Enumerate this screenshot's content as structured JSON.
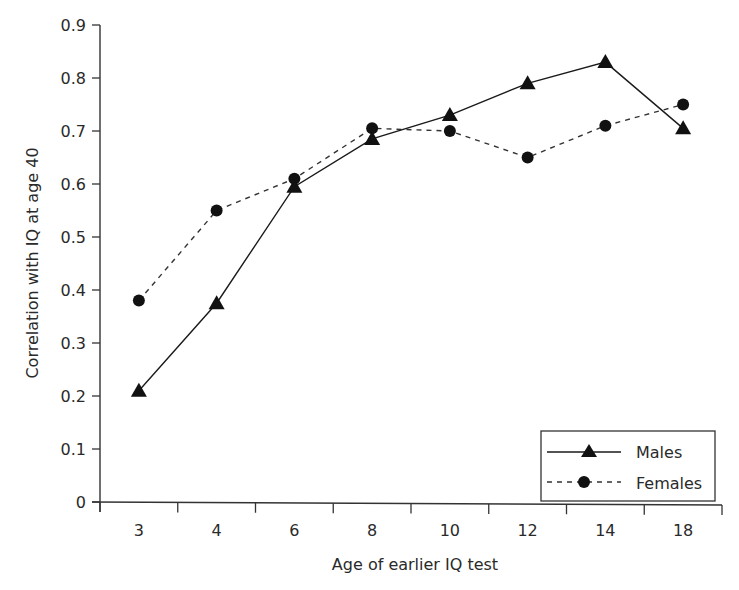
{
  "chart_data": {
    "type": "line",
    "title": "",
    "xlabel": "Age of earlier IQ test",
    "ylabel": "Correlation with IQ at age 40",
    "categories": [
      "3",
      "4",
      "6",
      "8",
      "10",
      "12",
      "14",
      "18"
    ],
    "ylim": [
      0,
      0.9
    ],
    "yticks": [
      "0",
      "0.1",
      "0.2",
      "0.3",
      "0.4",
      "0.5",
      "0.6",
      "0.7",
      "0.8",
      "0.9"
    ],
    "grid": false,
    "legend_position": "lower right",
    "series": [
      {
        "name": "Males",
        "marker": "triangle",
        "line": "solid",
        "values": [
          0.21,
          0.375,
          0.595,
          0.685,
          0.73,
          0.79,
          0.83,
          0.705
        ]
      },
      {
        "name": "Females",
        "marker": "circle",
        "line": "dashed",
        "values": [
          0.38,
          0.55,
          0.61,
          0.705,
          0.7,
          0.65,
          0.71,
          0.75
        ]
      }
    ]
  },
  "colors": {
    "ink": "#1a1a1a",
    "axis": "#333333",
    "background": "#ffffff"
  }
}
